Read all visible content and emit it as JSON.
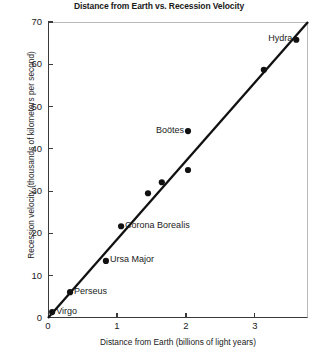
{
  "chart_data": {
    "type": "scatter",
    "title": "Distance from Earth vs. Recession Velocity",
    "xlabel": "Distance from Earth (billions of light years)",
    "ylabel": "Recession velocity (thousands of kilometers per second)",
    "xlim": [
      0,
      3.77
    ],
    "ylim": [
      0,
      70
    ],
    "xticks": [
      0,
      1,
      2,
      3
    ],
    "xtick_labels": [
      "0",
      "1",
      "2",
      "3"
    ],
    "yticks": [
      0,
      10,
      20,
      30,
      40,
      50,
      60,
      70
    ],
    "ytick_labels": [
      "0",
      "10",
      "20",
      "30",
      "40",
      "50",
      "60",
      "70"
    ],
    "grid": false,
    "legend": false,
    "trendline": {
      "description": "straight line through origin",
      "x_start": 0.0,
      "y_start": 0.0,
      "x_end": 3.77,
      "y_end": 70.0,
      "slope": 18.6
    },
    "points": [
      {
        "name": "Virgo",
        "x": 0.06,
        "y": 1.4,
        "label": "Virgo",
        "label_side": "right"
      },
      {
        "name": "Perseus",
        "x": 0.32,
        "y": 6.1,
        "label": "Perseus",
        "label_side": "right"
      },
      {
        "name": "Ursa Major",
        "x": 0.84,
        "y": 13.5,
        "label": "Ursa Major",
        "label_side": "right"
      },
      {
        "name": "Corona Borealis",
        "x": 1.06,
        "y": 21.7,
        "label": "Corona Borealis",
        "label_side": "right"
      },
      {
        "name": "unlabeled-1",
        "x": 1.45,
        "y": 29.5,
        "label": "",
        "label_side": "none"
      },
      {
        "name": "unlabeled-2",
        "x": 1.65,
        "y": 32.1,
        "label": "",
        "label_side": "none"
      },
      {
        "name": "unlabeled-3",
        "x": 2.03,
        "y": 35.0,
        "label": "",
        "label_side": "none"
      },
      {
        "name": "Bootes",
        "x": 2.03,
        "y": 44.2,
        "label": "Boötes",
        "label_side": "left"
      },
      {
        "name": "unlabeled-4",
        "x": 3.13,
        "y": 58.7,
        "label": "",
        "label_side": "none"
      },
      {
        "name": "Hydra",
        "x": 3.6,
        "y": 65.8,
        "label": "Hydra",
        "label_side": "left"
      }
    ],
    "colors": {
      "marker": "#111111",
      "line": "#111111",
      "axis": "#3a3a3a",
      "text": "#1a1a1a"
    }
  }
}
